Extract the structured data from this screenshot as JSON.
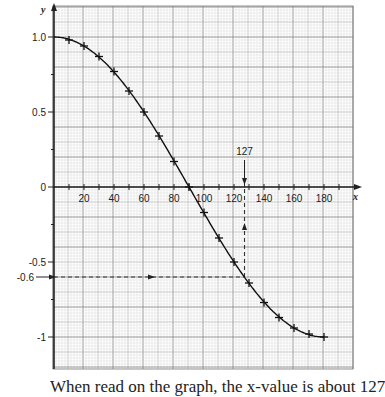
{
  "chart_data": {
    "type": "line",
    "title": "",
    "function": "y = cos x",
    "xlabel": "x",
    "ylabel": "y",
    "xlim": [
      0,
      198
    ],
    "ylim": [
      -1.2,
      1.2
    ],
    "grid": true,
    "x_ticks": [
      20,
      40,
      60,
      80,
      100,
      120,
      140,
      160,
      180
    ],
    "x_tick_labels": [
      "20",
      "40",
      "60",
      "80",
      "100",
      "120",
      "140",
      "160",
      "180"
    ],
    "y_ticks": [
      1.0,
      0.5,
      0,
      -0.5,
      -1
    ],
    "y_tick_labels": [
      "1.0",
      "0.5",
      "0",
      "-0.5",
      "-1"
    ],
    "series": [
      {
        "name": "cos x",
        "x": [
          0,
          10,
          20,
          30,
          40,
          50,
          60,
          70,
          80,
          90,
          100,
          110,
          120,
          130,
          140,
          150,
          160,
          170,
          180
        ],
        "values": [
          1.0,
          0.98,
          0.94,
          0.87,
          0.77,
          0.64,
          0.5,
          0.34,
          0.17,
          0.0,
          -0.17,
          -0.34,
          -0.5,
          -0.64,
          -0.77,
          -0.87,
          -0.94,
          -0.98,
          -1.0
        ],
        "markers_at": [
          10,
          20,
          30,
          40,
          50,
          60,
          70,
          80,
          90,
          100,
          110,
          120,
          130,
          140,
          150,
          160,
          170,
          180
        ]
      }
    ],
    "annotations": [
      {
        "type": "horizontal-dashed",
        "y": -0.6,
        "x_from": 0,
        "x_to": 127,
        "label": "-0.6"
      },
      {
        "type": "vertical-dashed",
        "x": 127,
        "y_from": -0.6,
        "y_to": 0,
        "label": "127"
      }
    ]
  },
  "caption": "When read on the graph, the x-value is about 127"
}
